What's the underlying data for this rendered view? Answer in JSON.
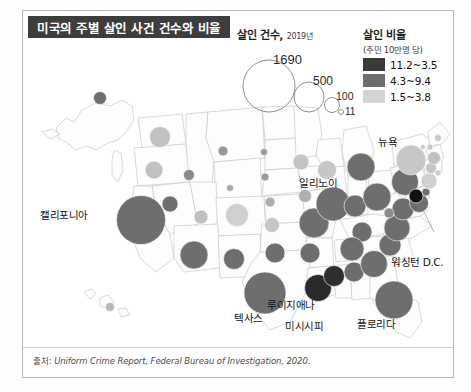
{
  "header": {
    "title": "미국의 주별 살인 사건 건수와 비율",
    "title_bg": "#3d3d3d",
    "title_color": "#ffffff"
  },
  "legend_size": {
    "title": "살인 건수,",
    "year": "2019년",
    "items": [
      {
        "label": "1690",
        "value": 1690
      },
      {
        "label": "500",
        "value": 500
      },
      {
        "label": "100",
        "value": 100
      },
      {
        "label": "11",
        "value": 11
      }
    ]
  },
  "legend_color": {
    "title": "살인 비율",
    "subtitle": "(주민 10만명 당)",
    "items": [
      {
        "label": "11.2~3.5",
        "color": "#3a3a3a"
      },
      {
        "label": "4.3~9.4",
        "color": "#6e6e6e"
      },
      {
        "label": "1.5~3.8",
        "color": "#d4d4d4"
      }
    ]
  },
  "map_labels": [
    {
      "name": "california",
      "text": "캘리포니아",
      "x": 40,
      "y": 207
    },
    {
      "name": "illinois",
      "text": "일리노이",
      "x": 299,
      "y": 175
    },
    {
      "name": "newyork",
      "text": "뉴욕",
      "x": 378,
      "y": 134
    },
    {
      "name": "washington-dc",
      "text": "워싱턴 D.C.",
      "x": 391,
      "y": 254
    },
    {
      "name": "texas",
      "text": "텍사스",
      "x": 234,
      "y": 310
    },
    {
      "name": "louisiana",
      "text": "루이지애나",
      "x": 267,
      "y": 297
    },
    {
      "name": "mississippi",
      "text": "미시시피",
      "x": 285,
      "y": 318
    },
    {
      "name": "florida",
      "text": "플로리다",
      "x": 357,
      "y": 316
    }
  ],
  "source": {
    "prefix": "출처:",
    "text": "Uniform Crime Report, Federal Bureau of Investigation, 2020."
  },
  "chart_data": {
    "type": "bubble-map",
    "title": "미국의 주별 살인 사건 건수와 비율",
    "size_metric": "살인 건수 (2019년)",
    "color_metric": "살인 비율 (주민 10만명 당)",
    "size_legend_values": [
      1690,
      500,
      100,
      11
    ],
    "color_bins": [
      "11.2~3.5",
      "4.3~9.4",
      "1.5~3.8"
    ],
    "color_bin_colors": [
      "#3a3a3a",
      "#6e6e6e",
      "#d4d4d4"
    ],
    "bubbles": [
      {
        "state": "Alaska",
        "cx": 78,
        "cy": 88,
        "r": 6.5,
        "color": "#6e6e6e"
      },
      {
        "state": "Hawaii",
        "cx": 88,
        "cy": 297,
        "r": 4.5,
        "color": "#b8b8b8"
      },
      {
        "state": "Washington",
        "cx": 138,
        "cy": 127,
        "r": 10.5,
        "color": "#c2c2c2"
      },
      {
        "state": "Oregon",
        "cx": 132,
        "cy": 160,
        "r": 9.0,
        "color": "#c2c2c2"
      },
      {
        "state": "Idaho",
        "cx": 167,
        "cy": 165,
        "r": 5.5,
        "color": "#8a8a8a"
      },
      {
        "state": "Montana",
        "cx": 201,
        "cy": 141,
        "r": 5.0,
        "color": "#9a9a9a"
      },
      {
        "state": "Wyoming",
        "cx": 208,
        "cy": 178,
        "r": 3.5,
        "color": "#a8a8a8"
      },
      {
        "state": "Nevada",
        "cx": 148,
        "cy": 194,
        "r": 8.0,
        "color": "#6e6e6e"
      },
      {
        "state": "California",
        "cx": 119,
        "cy": 210,
        "r": 24.5,
        "color": "#6e6e6e"
      },
      {
        "state": "Utah",
        "cx": 179,
        "cy": 207,
        "r": 7.0,
        "color": "#c0c0c0"
      },
      {
        "state": "Colorado",
        "cx": 215,
        "cy": 205,
        "r": 11.5,
        "color": "#cfcfcf"
      },
      {
        "state": "Arizona",
        "cx": 172,
        "cy": 245,
        "r": 14.0,
        "color": "#6e6e6e"
      },
      {
        "state": "New Mexico",
        "cx": 212,
        "cy": 249,
        "r": 10.5,
        "color": "#6e6e6e"
      },
      {
        "state": "North Dakota",
        "cx": 242,
        "cy": 142,
        "r": 3.5,
        "color": "#9a9a9a"
      },
      {
        "state": "South Dakota",
        "cx": 243,
        "cy": 167,
        "r": 4.0,
        "color": "#9a9a9a"
      },
      {
        "state": "Nebraska",
        "cx": 248,
        "cy": 192,
        "r": 5.0,
        "color": "#aeaeae"
      },
      {
        "state": "Kansas",
        "cx": 250,
        "cy": 215,
        "r": 7.5,
        "color": "#c6c6c6"
      },
      {
        "state": "Oklahoma",
        "cx": 253,
        "cy": 243,
        "r": 10.0,
        "color": "#6e6e6e"
      },
      {
        "state": "Texas",
        "cx": 243,
        "cy": 283,
        "r": 21.0,
        "color": "#6e6e6e"
      },
      {
        "state": "Minnesota",
        "cx": 279,
        "cy": 152,
        "r": 8.0,
        "color": "#c4c4c4"
      },
      {
        "state": "Iowa",
        "cx": 283,
        "cy": 186,
        "r": 6.5,
        "color": "#b0b0b0"
      },
      {
        "state": "Missouri",
        "cx": 292,
        "cy": 213,
        "r": 15.0,
        "color": "#6e6e6e"
      },
      {
        "state": "Arkansas",
        "cx": 288,
        "cy": 243,
        "r": 10.0,
        "color": "#6e6e6e"
      },
      {
        "state": "Louisiana",
        "cx": 296,
        "cy": 278,
        "r": 13.5,
        "color": "#2a2a2a"
      },
      {
        "state": "Mississippi",
        "cx": 312,
        "cy": 266,
        "r": 10.5,
        "color": "#2f2f2f"
      },
      {
        "state": "Wisconsin",
        "cx": 305,
        "cy": 160,
        "r": 9.5,
        "color": "#c6c6c6"
      },
      {
        "state": "Illinois",
        "cx": 311,
        "cy": 194,
        "r": 17.0,
        "color": "#6e6e6e"
      },
      {
        "state": "Michigan",
        "cx": 339,
        "cy": 157,
        "r": 14.0,
        "color": "#6e6e6e"
      },
      {
        "state": "Indiana",
        "cx": 333,
        "cy": 196,
        "r": 11.0,
        "color": "#6e6e6e"
      },
      {
        "state": "Ohio",
        "cx": 355,
        "cy": 187,
        "r": 14.0,
        "color": "#6e6e6e"
      },
      {
        "state": "Kentucky",
        "cx": 340,
        "cy": 222,
        "r": 10.0,
        "color": "#6e6e6e"
      },
      {
        "state": "Tennessee",
        "cx": 330,
        "cy": 239,
        "r": 12.0,
        "color": "#6e6e6e"
      },
      {
        "state": "Alabama",
        "cx": 332,
        "cy": 262,
        "r": 10.0,
        "color": "#6e6e6e"
      },
      {
        "state": "Georgia",
        "cx": 352,
        "cy": 254,
        "r": 13.5,
        "color": "#6e6e6e"
      },
      {
        "state": "Florida",
        "cx": 372,
        "cy": 290,
        "r": 19.0,
        "color": "#6e6e6e"
      },
      {
        "state": "South Carolina",
        "cx": 368,
        "cy": 235,
        "r": 11.0,
        "color": "#6e6e6e"
      },
      {
        "state": "North Carolina",
        "cx": 375,
        "cy": 218,
        "r": 13.0,
        "color": "#6e6e6e"
      },
      {
        "state": "Virginia",
        "cx": 381,
        "cy": 199,
        "r": 11.0,
        "color": "#6e6e6e"
      },
      {
        "state": "West Virginia",
        "cx": 367,
        "cy": 203,
        "r": 5.0,
        "color": "#8a8a8a"
      },
      {
        "state": "Pennsylvania",
        "cx": 383,
        "cy": 172,
        "r": 13.5,
        "color": "#6e6e6e"
      },
      {
        "state": "New York",
        "cx": 389,
        "cy": 150,
        "r": 15.0,
        "color": "#c8c8c8"
      },
      {
        "state": "Maryland",
        "cx": 397,
        "cy": 193,
        "r": 9.5,
        "color": "#6e6e6e"
      },
      {
        "state": "Washington DC",
        "cx": 394,
        "cy": 186,
        "r": 7.0,
        "color": "#111111"
      },
      {
        "state": "Delaware",
        "cx": 404,
        "cy": 182,
        "r": 4.0,
        "color": "#6e6e6e"
      },
      {
        "state": "New Jersey",
        "cx": 407,
        "cy": 171,
        "r": 8.0,
        "color": "#cfcfcf"
      },
      {
        "state": "Connecticut",
        "cx": 409,
        "cy": 158,
        "r": 5.5,
        "color": "#c4c4c4"
      },
      {
        "state": "Rhode Island",
        "cx": 416,
        "cy": 163,
        "r": 3.0,
        "color": "#cacaca"
      },
      {
        "state": "Massachusetts",
        "cx": 412,
        "cy": 148,
        "r": 6.5,
        "color": "#c2c2c2"
      },
      {
        "state": "Vermont",
        "cx": 401,
        "cy": 137,
        "r": 2.5,
        "color": "#c8c8c8"
      },
      {
        "state": "New Hampshire",
        "cx": 408,
        "cy": 137,
        "r": 3.0,
        "color": "#c8c8c8"
      },
      {
        "state": "Maine",
        "cx": 416,
        "cy": 128,
        "r": 3.5,
        "color": "#c8c8c8"
      }
    ]
  }
}
